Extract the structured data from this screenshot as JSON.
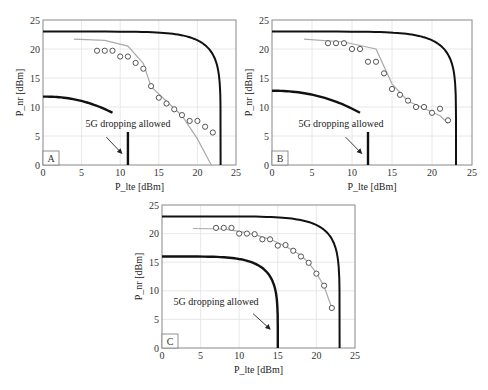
{
  "chart_data": [
    {
      "panel": "A",
      "type": "line",
      "xlabel": "P_lte [dBm]",
      "ylabel": "P_nr [dBm]",
      "xlim": [
        0,
        25
      ],
      "ylim": [
        0,
        25
      ],
      "xticks": [
        0,
        5,
        10,
        15,
        20,
        25
      ],
      "yticks": [
        0,
        5,
        10,
        15,
        20,
        25
      ],
      "grid": true,
      "annotation": "5G dropping allowed",
      "outer_boundary": {
        "name": "outer limit",
        "color": "#111111",
        "y_at_0": 23,
        "x_max": 23,
        "corner_rounding": 0.55
      },
      "inner_boundary": {
        "name": "inner limit",
        "color": "#111111",
        "y_at_0": 11.8,
        "x_end": 9,
        "y_end": 9
      },
      "drop_line": {
        "x": 11,
        "y_top": 5.7
      },
      "fit_line": {
        "name": "model",
        "color": "#aaaaaa",
        "x": [
          4,
          8,
          11,
          13,
          14,
          16,
          18,
          20,
          21.8
        ],
        "y": [
          21.7,
          21.5,
          20.5,
          17.5,
          13.5,
          11,
          8.5,
          4.5,
          0
        ]
      },
      "markers": {
        "name": "measured",
        "color": "#555555",
        "x": [
          7,
          8,
          9,
          10,
          11,
          12,
          13,
          14,
          15,
          16,
          17,
          18,
          19,
          20,
          21,
          22
        ],
        "y": [
          19.7,
          19.7,
          19.7,
          18.7,
          18.7,
          17.6,
          16.6,
          13.6,
          11.6,
          10.6,
          9.6,
          8.6,
          7.6,
          7.6,
          6.6,
          5.6
        ]
      }
    },
    {
      "panel": "B",
      "type": "line",
      "xlabel": "P_lte [dBm]",
      "ylabel": "P_nr [dBm]",
      "xlim": [
        0,
        25
      ],
      "ylim": [
        0,
        25
      ],
      "xticks": [
        0,
        5,
        10,
        15,
        20,
        25
      ],
      "yticks": [
        0,
        5,
        10,
        15,
        20,
        25
      ],
      "grid": true,
      "annotation": "5G dropping allowed",
      "outer_boundary": {
        "name": "outer limit",
        "color": "#111111",
        "y_at_0": 23,
        "x_max": 23,
        "corner_rounding": 0.55
      },
      "inner_boundary": {
        "name": "inner limit",
        "color": "#111111",
        "y_at_0": 12.8,
        "x_end": 11,
        "y_end": 9
      },
      "drop_line": {
        "x": 12,
        "y_top": 5.7
      },
      "fit_line": {
        "name": "model",
        "color": "#aaaaaa",
        "x": [
          4,
          9,
          13,
          15,
          17,
          19,
          21,
          22
        ],
        "y": [
          21.7,
          21.2,
          20,
          14,
          11,
          9.8,
          8.5,
          7.2
        ]
      },
      "markers": {
        "name": "measured",
        "color": "#555555",
        "x": [
          7,
          8,
          9,
          10,
          11,
          12,
          13,
          14,
          15,
          16,
          17,
          18,
          19,
          20,
          21,
          22
        ],
        "y": [
          21,
          21,
          21,
          20,
          20,
          17.8,
          17.8,
          15.8,
          13.1,
          12.1,
          11.1,
          10,
          10,
          9,
          9.7,
          7.7
        ]
      }
    },
    {
      "panel": "C",
      "type": "line",
      "xlabel": "P_lte [dBm]",
      "ylabel": "P_nr [dBm]",
      "xlim": [
        0,
        25
      ],
      "ylim": [
        0,
        25
      ],
      "xticks": [
        0,
        5,
        10,
        15,
        20,
        25
      ],
      "yticks": [
        0,
        5,
        10,
        15,
        20,
        25
      ],
      "grid": true,
      "annotation": "5G dropping allowed",
      "outer_boundary": {
        "name": "outer limit",
        "color": "#111111",
        "y_at_0": 23,
        "x_max": 23,
        "corner_rounding": 0.55
      },
      "inner_boundary": {
        "name": "inner limit",
        "color": "#111111",
        "y_at_0": 16,
        "x_end": 15,
        "y_end": 0
      },
      "drop_line": null,
      "fit_line": {
        "name": "model",
        "color": "#aaaaaa",
        "x": [
          4,
          8,
          10,
          12,
          14,
          16,
          18,
          19,
          20,
          21,
          22
        ],
        "y": [
          20.9,
          20.8,
          20.4,
          19.8,
          19,
          17.8,
          16.2,
          14.9,
          13.1,
          10.8,
          7
        ]
      },
      "markers": {
        "name": "measured",
        "color": "#555555",
        "x": [
          7,
          8,
          9,
          10,
          11,
          12,
          13,
          14,
          15,
          16,
          17,
          18,
          19,
          20,
          21,
          22
        ],
        "y": [
          21,
          21,
          21,
          20,
          20,
          19.9,
          19,
          19,
          17.9,
          18,
          17,
          16,
          14.9,
          13,
          10.9,
          7
        ]
      }
    }
  ],
  "panels": [
    {
      "id": "A",
      "label": "A",
      "box": {
        "x0": 43,
        "y0": 20,
        "x1": 236,
        "y1": 165
      },
      "annotation_pos": {
        "x": 5.5,
        "y": 6.6
      },
      "arrow_from": {
        "x": 8.2,
        "y": 4.8
      },
      "arrow_to": {
        "x": 10.2,
        "y": 2
      }
    },
    {
      "id": "B",
      "label": "B",
      "box": {
        "x0": 272,
        "y0": 20,
        "x1": 472,
        "y1": 165
      },
      "annotation_pos": {
        "x": 3.3,
        "y": 6.6
      },
      "arrow_from": {
        "x": 9.2,
        "y": 4.8
      },
      "arrow_to": {
        "x": 11.2,
        "y": 2
      }
    },
    {
      "id": "C",
      "label": "C",
      "box": {
        "x0": 162,
        "y0": 205,
        "x1": 355,
        "y1": 348
      },
      "annotation_pos": {
        "x": 1.5,
        "y": 7.5
      },
      "arrow_from": {
        "x": 11.8,
        "y": 6
      },
      "arrow_to": {
        "x": 14,
        "y": 3.3
      }
    }
  ]
}
